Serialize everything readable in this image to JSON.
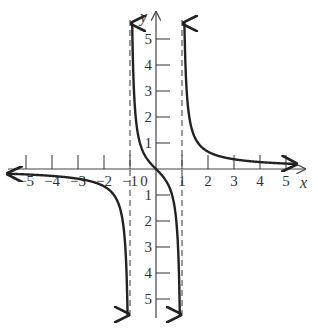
{
  "chart_data": {
    "type": "line",
    "title": "",
    "function": "y = x/(x^2 - 1)",
    "xlabel": "x",
    "ylabel": "y",
    "xlim": [
      -5.5,
      5.5
    ],
    "ylim": [
      -5.5,
      5.5
    ],
    "grid": false,
    "x_ticks": [
      -5,
      -4,
      -3,
      -2,
      -1,
      0,
      1,
      2,
      3,
      4,
      5
    ],
    "y_ticks": [
      -5,
      -4,
      -3,
      -2,
      -1,
      1,
      2,
      3,
      4,
      5
    ],
    "x_tick_labels": [
      "−5",
      "−4",
      "−3",
      "−2",
      "−1",
      "0",
      "1",
      "2",
      "3",
      "4",
      "5"
    ],
    "y_tick_labels": [
      "1",
      "2",
      "3",
      "4",
      "5",
      "−1",
      "−2",
      "−3",
      "−4",
      "−5"
    ],
    "vertical_asymptotes": [
      -1,
      1
    ],
    "horizontal_asymptote": 0,
    "series": [
      {
        "name": "left branch (x < -1)",
        "x": [
          -5.5,
          -5,
          -4,
          -3,
          -2,
          -1.5,
          -1.2,
          -1.1,
          -1.05
        ],
        "y": [
          -0.19,
          -0.21,
          -0.27,
          -0.375,
          -0.67,
          -1.2,
          -2.73,
          -5.24,
          -10.2
        ]
      },
      {
        "name": "middle branch (-1 < x < 1)",
        "x": [
          -0.95,
          -0.9,
          -0.8,
          -0.5,
          0,
          0.5,
          0.8,
          0.9,
          0.95
        ],
        "y": [
          9.74,
          4.74,
          2.22,
          0.67,
          0,
          -0.67,
          -2.22,
          -4.74,
          -9.74
        ]
      },
      {
        "name": "right branch (x > 1)",
        "x": [
          1.05,
          1.1,
          1.2,
          1.5,
          2,
          3,
          4,
          5,
          5.5
        ],
        "y": [
          10.2,
          5.24,
          2.73,
          1.2,
          0.67,
          0.375,
          0.27,
          0.21,
          0.19
        ]
      }
    ]
  },
  "axis_labels": {
    "x": "x",
    "y": "y"
  },
  "colors": {
    "curve": "#222222",
    "axis": "#444444",
    "asymptote": "#555555"
  }
}
